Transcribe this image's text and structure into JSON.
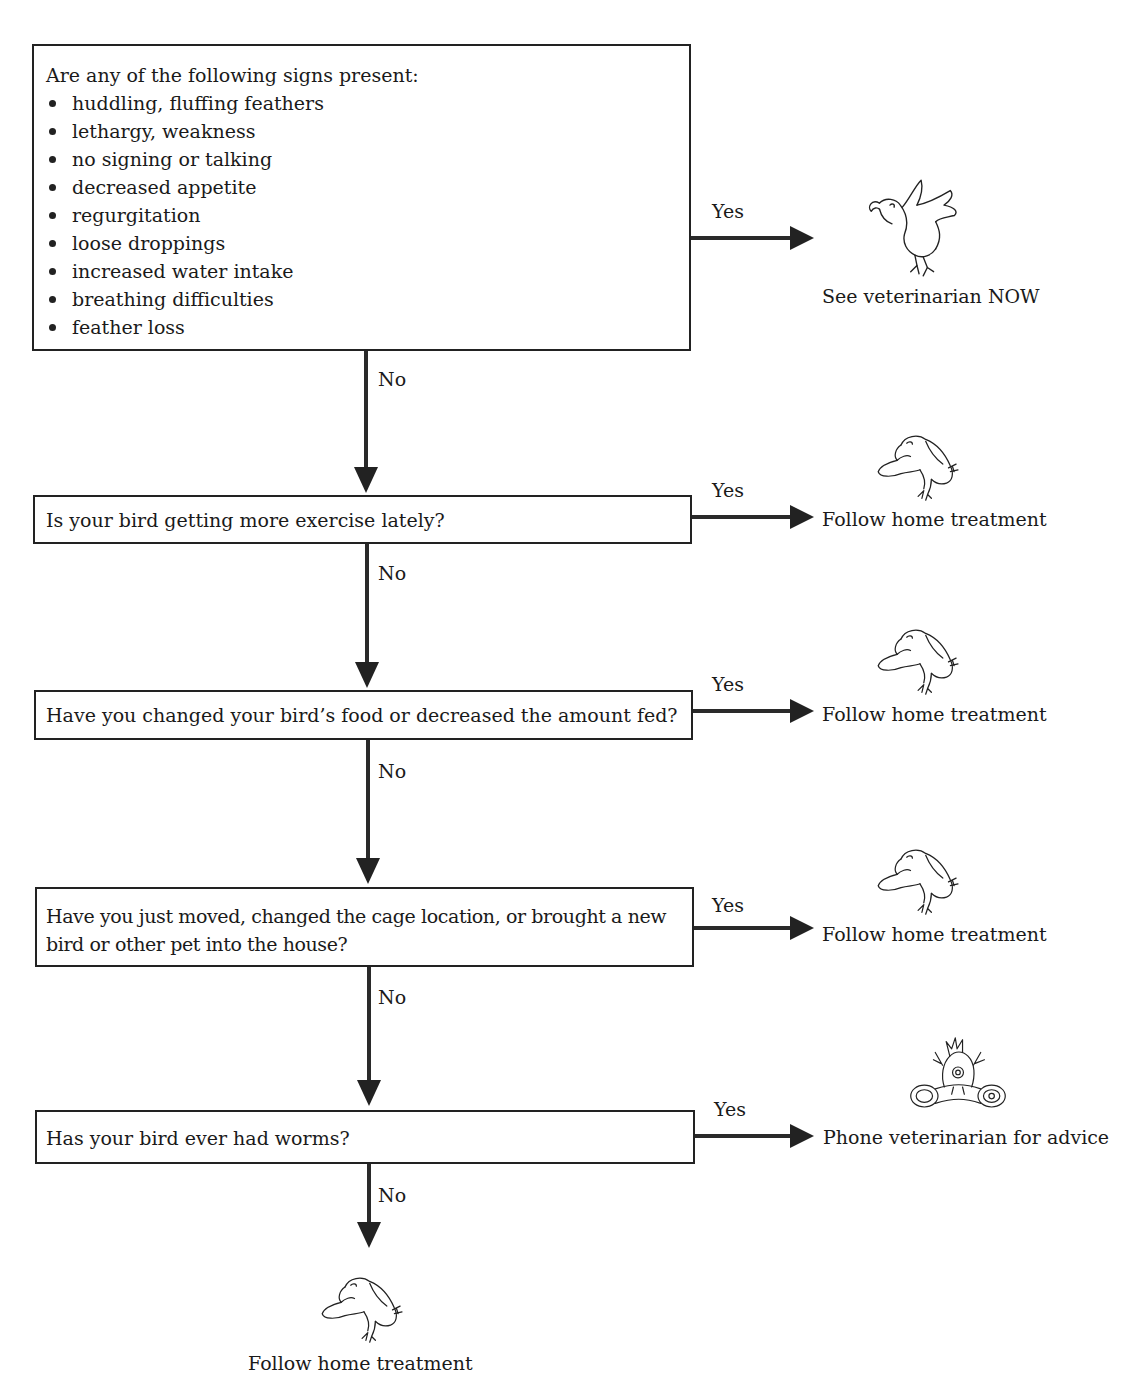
{
  "diagram": {
    "type": "flowchart",
    "nodes": {
      "q1": {
        "title": "Are any of the following signs present:",
        "signs": [
          "huddling, fluffing feathers",
          "lethargy, weakness",
          "no signing or talking",
          "decreased appetite",
          "regurgitation",
          "loose droppings",
          "increased water intake",
          "breathing difficulties",
          "feather loss"
        ]
      },
      "q2": {
        "text": "Is your bird getting more exercise lately?"
      },
      "q3": {
        "text": "Have you changed your bird’s food or decreased the amount fed?"
      },
      "q4": {
        "line1": "Have you just moved, changed the cage location, or brought a new",
        "line2": "bird or other pet into the house?"
      },
      "q5": {
        "text": "Has your bird ever had worms?"
      }
    },
    "outcomes": {
      "o1": {
        "text": "See veterinarian NOW",
        "icon": "alarmed-bird-icon"
      },
      "o2": {
        "text": "Follow home treatment",
        "icon": "sad-bird-icon"
      },
      "o3": {
        "text": "Follow home treatment",
        "icon": "sad-bird-icon"
      },
      "o4": {
        "text": "Follow home treatment",
        "icon": "sad-bird-icon"
      },
      "o5": {
        "text": "Phone veterinarian for advice",
        "icon": "bird-on-phone-icon"
      },
      "o6": {
        "text": "Follow home treatment",
        "icon": "sad-bird-icon"
      }
    },
    "edge_labels": {
      "yes": "Yes",
      "no": "No"
    },
    "edges": [
      {
        "from": "q1",
        "to": "o1",
        "label": "Yes"
      },
      {
        "from": "q1",
        "to": "q2",
        "label": "No"
      },
      {
        "from": "q2",
        "to": "o2",
        "label": "Yes"
      },
      {
        "from": "q2",
        "to": "q3",
        "label": "No"
      },
      {
        "from": "q3",
        "to": "o3",
        "label": "Yes"
      },
      {
        "from": "q3",
        "to": "q4",
        "label": "No"
      },
      {
        "from": "q4",
        "to": "o4",
        "label": "Yes"
      },
      {
        "from": "q4",
        "to": "q5",
        "label": "No"
      },
      {
        "from": "q5",
        "to": "o5",
        "label": "Yes"
      },
      {
        "from": "q5",
        "to": "o6",
        "label": "No"
      }
    ]
  }
}
